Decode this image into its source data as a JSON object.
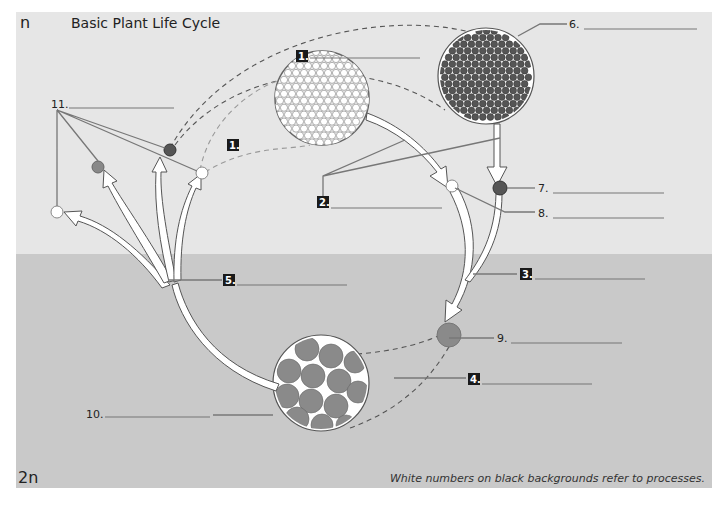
{
  "header": {
    "ploidy_top": "n",
    "title": "Basic Plant Life Cycle"
  },
  "footer": {
    "ploidy_bottom": "2n",
    "note": "White numbers on black backgrounds refer to processes."
  },
  "colors": {
    "haploid_bg": "#e6e6e6",
    "diploid_bg": "#c9c9c9",
    "dark_cell": "#555555",
    "medium_cell": "#8a8a8a",
    "light_cell": "#ffffff",
    "process_box": "#1a1a1a"
  },
  "labels": {
    "structures": [
      {
        "id": "6",
        "text": "6.",
        "value": ""
      },
      {
        "id": "7",
        "text": "7.",
        "value": ""
      },
      {
        "id": "8",
        "text": "8.",
        "value": ""
      },
      {
        "id": "9",
        "text": "9.",
        "value": ""
      },
      {
        "id": "10",
        "text": "10.",
        "value": ""
      },
      {
        "id": "11",
        "text": "11.",
        "value": ""
      }
    ],
    "processes": [
      {
        "id": "1a",
        "text": "1.",
        "value": ""
      },
      {
        "id": "1b",
        "text": "1.",
        "value": ""
      },
      {
        "id": "2",
        "text": "2.",
        "value": ""
      },
      {
        "id": "3",
        "text": "3.",
        "value": ""
      },
      {
        "id": "4",
        "text": "4.",
        "value": ""
      },
      {
        "id": "5",
        "text": "5.",
        "value": ""
      }
    ]
  },
  "icons": {
    "haploid_cell_mass_light": "white-cell-cluster-icon",
    "haploid_cell_mass_dark": "dark-cell-cluster-icon",
    "diploid_cell_mass": "diploid-cell-cluster-icon",
    "single_cell": "circle"
  }
}
